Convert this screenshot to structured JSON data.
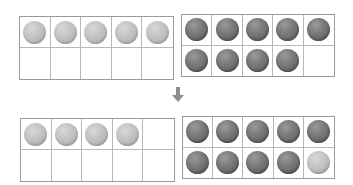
{
  "colors": {
    "frame_border": "#9a9a9a",
    "cell_border": "#b8b8b8",
    "light_counter": "#c2c2c2",
    "dark_counter": "#707070",
    "arrow": "#8c8c8c"
  },
  "frames": [
    {
      "id": "top-left",
      "position": "before",
      "rows": [
        [
          "light",
          "light",
          "light",
          "light",
          "light"
        ],
        [
          "empty",
          "empty",
          "empty",
          "empty",
          "empty"
        ]
      ],
      "count": 5
    },
    {
      "id": "top-right",
      "position": "before",
      "rows": [
        [
          "dark",
          "dark",
          "dark",
          "dark",
          "dark"
        ],
        [
          "dark",
          "dark",
          "dark",
          "dark",
          "empty"
        ]
      ],
      "count": 9
    },
    {
      "id": "bottom-left",
      "position": "after",
      "rows": [
        [
          "light",
          "light",
          "light",
          "light",
          "empty"
        ],
        [
          "empty",
          "empty",
          "empty",
          "empty",
          "empty"
        ]
      ],
      "count": 4
    },
    {
      "id": "bottom-right",
      "position": "after",
      "rows": [
        [
          "dark",
          "dark",
          "dark",
          "dark",
          "dark"
        ],
        [
          "dark",
          "dark",
          "dark",
          "dark",
          "light"
        ]
      ],
      "count": 10
    }
  ],
  "arrow": {
    "icon": "arrow-down-icon",
    "direction": "down"
  }
}
